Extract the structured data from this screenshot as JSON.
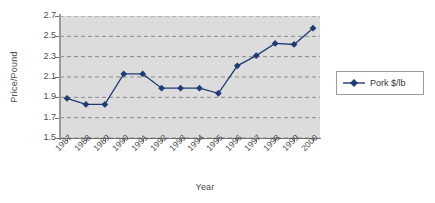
{
  "chart_data": {
    "type": "line",
    "title": "",
    "xlabel": "Year",
    "ylabel": "Price/Pound",
    "categories": [
      "1987",
      "1988",
      "1989",
      "1990",
      "1991",
      "1992",
      "1993",
      "1994",
      "1995",
      "1996",
      "1997",
      "1998",
      "1999",
      "2000"
    ],
    "series": [
      {
        "name": "Pork $/lb",
        "color": "#1F3B73",
        "marker": "diamond",
        "values": [
          1.89,
          1.83,
          1.83,
          2.13,
          2.13,
          1.99,
          1.99,
          1.99,
          1.94,
          2.21,
          2.31,
          2.43,
          2.42,
          2.58
        ]
      }
    ],
    "ylim": [
      1.5,
      2.7
    ],
    "ytick_labels": [
      "2.7",
      "2.5",
      "2.3",
      "2.1",
      "1.9",
      "1.7",
      "1.5"
    ],
    "ytick_values": [
      2.7,
      2.5,
      2.3,
      2.1,
      1.9,
      1.7,
      1.5
    ],
    "grid": "horizontal-dashed",
    "plot_background": "#DCDCDC",
    "gridline_color": "#8A8A8A",
    "legend_position": "right"
  },
  "legend": {
    "entries": [
      {
        "label": "Pork $/lb",
        "color": "#1F3B73"
      }
    ]
  },
  "axes": {
    "y_title": "Price/Pound",
    "x_title": "Year"
  }
}
